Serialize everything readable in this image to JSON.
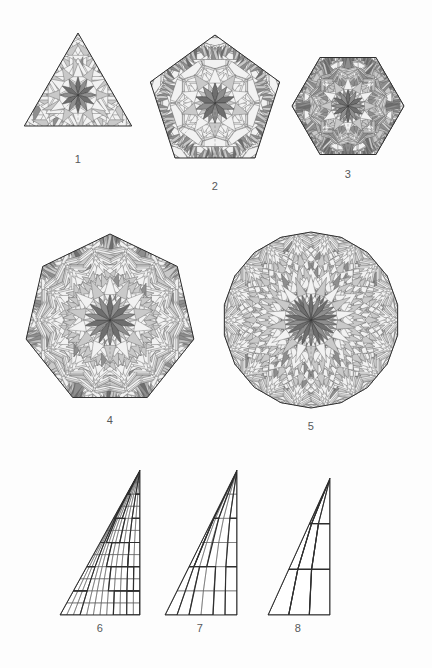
{
  "plate": {
    "title": "Rhombic tilings of regular polygons and triangular zonogon decompositions",
    "background_color": "#fdfdfd",
    "width": 432,
    "height": 668,
    "rows": [
      {
        "name": "row-top",
        "figures": [
          "1",
          "2",
          "3"
        ]
      },
      {
        "name": "row-middle",
        "figures": [
          "4",
          "5"
        ]
      },
      {
        "name": "row-bottom",
        "figures": [
          "6",
          "7",
          "8"
        ]
      }
    ]
  },
  "palette": {
    "stroke_thin": "#5b5b5b",
    "stroke_thick": "#3a3a3a",
    "stroke_outline": "#2e2e2e",
    "tile_light": "#f2f2f2",
    "tile_mid": "#c9c9c9",
    "tile_dark": "#8e8e8e",
    "tile_darkest": "#6e6e6e",
    "label_color": "#56585a",
    "paper": "#fdfdfd"
  },
  "figures": [
    {
      "id": "fig-1",
      "label": "1",
      "kind": "rhombic-tiling",
      "shape": "triangle",
      "sides": 3,
      "zones": 6,
      "rosette_order": 12,
      "cx": 78,
      "cy": 95,
      "r": 62,
      "rotation": -90,
      "label_x": 63,
      "label_y": 153
    },
    {
      "id": "fig-2",
      "label": "2",
      "kind": "rhombic-tiling",
      "shape": "pentagon",
      "sides": 5,
      "zones": 10,
      "rosette_order": 10,
      "cx": 215,
      "cy": 103,
      "r": 68,
      "rotation": -90,
      "label_x": 200,
      "label_y": 180
    },
    {
      "id": "fig-3",
      "label": "3",
      "kind": "rhombic-tiling",
      "shape": "hexagon",
      "sides": 6,
      "zones": 12,
      "rosette_order": 12,
      "cx": 348,
      "cy": 106,
      "r": 56,
      "rotation": 0,
      "label_x": 333,
      "label_y": 168
    },
    {
      "id": "fig-4",
      "label": "4",
      "kind": "rhombic-tiling",
      "shape": "heptagon",
      "sides": 7,
      "zones": 14,
      "rosette_order": 14,
      "cx": 110,
      "cy": 320,
      "r": 86,
      "rotation": -90,
      "label_x": 95,
      "label_y": 414
    },
    {
      "id": "fig-5",
      "label": "5",
      "kind": "rhombic-tiling",
      "shape": "polygon",
      "sides": 18,
      "zones": 18,
      "rosette_order": 18,
      "cx": 311,
      "cy": 320,
      "r": 88,
      "rotation": -90,
      "label_x": 296,
      "label_y": 420
    },
    {
      "id": "fig-6",
      "label": "6",
      "kind": "staircase-zonogon",
      "shape": "right-triangle",
      "density": 12,
      "x": 60,
      "y": 470,
      "w": 80,
      "h": 145,
      "label_x": 85,
      "label_y": 622
    },
    {
      "id": "fig-7",
      "label": "7",
      "kind": "staircase-zonogon",
      "shape": "right-triangle",
      "density": 6,
      "x": 165,
      "y": 470,
      "w": 72,
      "h": 145,
      "label_x": 185,
      "label_y": 622
    },
    {
      "id": "fig-8",
      "label": "8",
      "kind": "staircase-zonogon",
      "shape": "right-triangle",
      "density": 3,
      "x": 268,
      "y": 478,
      "w": 62,
      "h": 137,
      "label_x": 283,
      "label_y": 622
    }
  ],
  "chart_data": {
    "type": "diagram",
    "items": [
      {
        "label": "1",
        "shape": "triangle",
        "sides": 3,
        "rosette_order": 12,
        "tiling": "rhombic"
      },
      {
        "label": "2",
        "shape": "pentagon",
        "sides": 5,
        "rosette_order": 10,
        "tiling": "rhombic"
      },
      {
        "label": "3",
        "shape": "hexagon",
        "sides": 6,
        "rosette_order": 12,
        "tiling": "rhombic"
      },
      {
        "label": "4",
        "shape": "heptagon",
        "sides": 7,
        "rosette_order": 14,
        "tiling": "rhombic"
      },
      {
        "label": "5",
        "shape": "near-circular polygon",
        "sides": 18,
        "rosette_order": 18,
        "tiling": "rhombic"
      },
      {
        "label": "6",
        "shape": "right triangle",
        "mesh_density": "fine",
        "tiling": "staircase grid"
      },
      {
        "label": "7",
        "shape": "right triangle",
        "mesh_density": "medium",
        "tiling": "staircase grid"
      },
      {
        "label": "8",
        "shape": "right triangle",
        "mesh_density": "coarse",
        "tiling": "staircase grid"
      }
    ]
  }
}
